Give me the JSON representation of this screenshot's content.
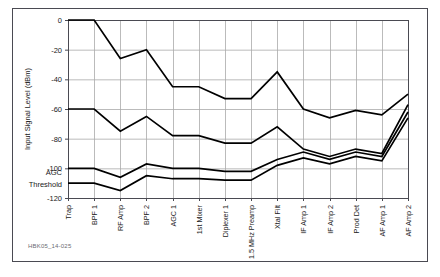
{
  "figure": {
    "caption_id": "HBK05_14-025",
    "frame_color": "#4a4a52",
    "grid_color": "#aaaaaa",
    "line_color": "#000000",
    "text_color": "#1a1a1a"
  },
  "annotations": {
    "agc_line1": "AGC",
    "agc_line2": "Threshold"
  },
  "chart_data": {
    "type": "line",
    "title": "",
    "xlabel": "",
    "ylabel": "Input Signal Level (dBm)",
    "ylim": [
      -120,
      0
    ],
    "yticks": [
      0,
      -20,
      -40,
      -60,
      -80,
      -100,
      -120
    ],
    "ytick_labels": [
      "0",
      "-20",
      "-40",
      "-60",
      "-80",
      "-100",
      "-120"
    ],
    "grid": true,
    "legend": "none",
    "categories": [
      "Trap",
      "BPF 1",
      "RF Amp",
      "BPF 2",
      "AGC 1",
      "1st Mixer",
      "Diplexer 1",
      "1.5 MHz Preamp",
      "Xtal Filt",
      "IF Amp 1",
      "IF Amp 2",
      "Prod Det",
      "AF Amp 1",
      "AF Amp 2"
    ],
    "series": [
      {
        "name": "Maximum signal level",
        "values": [
          0,
          0,
          -26,
          -20,
          -45,
          -45,
          -53,
          -53,
          -35,
          -60,
          -66,
          -61,
          -64,
          -50
        ]
      },
      {
        "name": "Nominal signal level",
        "values": [
          -60,
          -60,
          -75,
          -65,
          -78,
          -78,
          -83,
          -83,
          -72,
          -87,
          -92,
          -87,
          -90,
          -57
        ]
      },
      {
        "name": "AGC threshold upper",
        "values": [
          -100,
          -100,
          -106,
          -97,
          -100,
          -100,
          -102,
          -102,
          -94,
          -89,
          -94,
          -89,
          -92,
          -62
        ]
      },
      {
        "name": "AGC threshold lower",
        "values": [
          -110,
          -110,
          -115,
          -105,
          -107,
          -107,
          -108,
          -108,
          -98,
          -93,
          -97,
          -92,
          -95,
          -66
        ]
      }
    ]
  }
}
